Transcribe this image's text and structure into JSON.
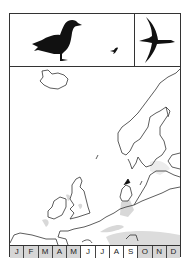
{
  "header": {
    "left_panel": {
      "icons": [
        "standing-goose-silhouette-icon",
        "small-bird-silhouette-icon"
      ]
    },
    "right_panel": {
      "icons": [
        "flying-goose-silhouette-icon"
      ]
    }
  },
  "map": {
    "region": "Northwestern Europe",
    "shading_color": "#d8d8d8",
    "outline_color": "#333333"
  },
  "months": [
    {
      "label": "J",
      "active": true
    },
    {
      "label": "F",
      "active": true
    },
    {
      "label": "M",
      "active": true
    },
    {
      "label": "A",
      "active": true
    },
    {
      "label": "M",
      "active": true
    },
    {
      "label": "J",
      "active": false
    },
    {
      "label": "J",
      "active": false
    },
    {
      "label": "A",
      "active": false
    },
    {
      "label": "S",
      "active": false
    },
    {
      "label": "O",
      "active": true
    },
    {
      "label": "N",
      "active": true
    },
    {
      "label": "D",
      "active": true
    }
  ],
  "colors": {
    "active_month": "#d6d6d6",
    "inactive_month": "#ffffff",
    "border": "#333333"
  }
}
